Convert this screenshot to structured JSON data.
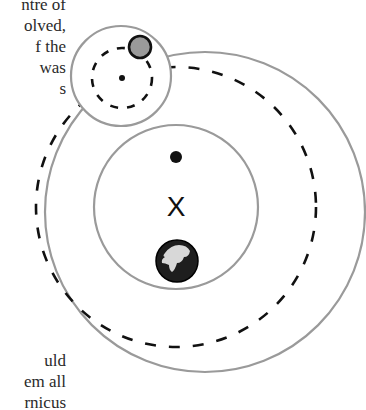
{
  "text": {
    "top_lines": [
      "ntre of",
      "olved,",
      "f  the",
      "was",
      "s"
    ],
    "bottom_lines": [
      "uld",
      "em all",
      "rnicus"
    ]
  },
  "diagram": {
    "type": "epicycle-deferent model",
    "colors": {
      "circle_stroke": "#9a9a9a",
      "dash_stroke": "#111111",
      "planet_fill": "#9a9a9a",
      "planet_stroke": "#111111",
      "earth_dark": "#1e1e1e",
      "earth_land": "#d8d8d8"
    },
    "outer_circle": {
      "cx": 205,
      "cy": 212,
      "r": 160
    },
    "inner_circle": {
      "cx": 176,
      "cy": 207,
      "r": 82
    },
    "deferent_dashed": {
      "cx": 176,
      "cy": 207,
      "r": 140
    },
    "epicycle_circle": {
      "cx": 121,
      "cy": 76,
      "r": 50
    },
    "epicycle_dashed": {
      "cx": 122,
      "cy": 78,
      "r": 30
    },
    "epicycle_center_dot": {
      "cx": 122,
      "cy": 78,
      "r": 3
    },
    "equant_dot": {
      "cx": 176,
      "cy": 157,
      "r": 6
    },
    "center_mark": {
      "label": "X",
      "x": 176,
      "y": 207
    },
    "planet": {
      "cx": 140,
      "cy": 47,
      "r": 11
    },
    "earth": {
      "cx": 177,
      "cy": 261,
      "r": 21
    }
  }
}
